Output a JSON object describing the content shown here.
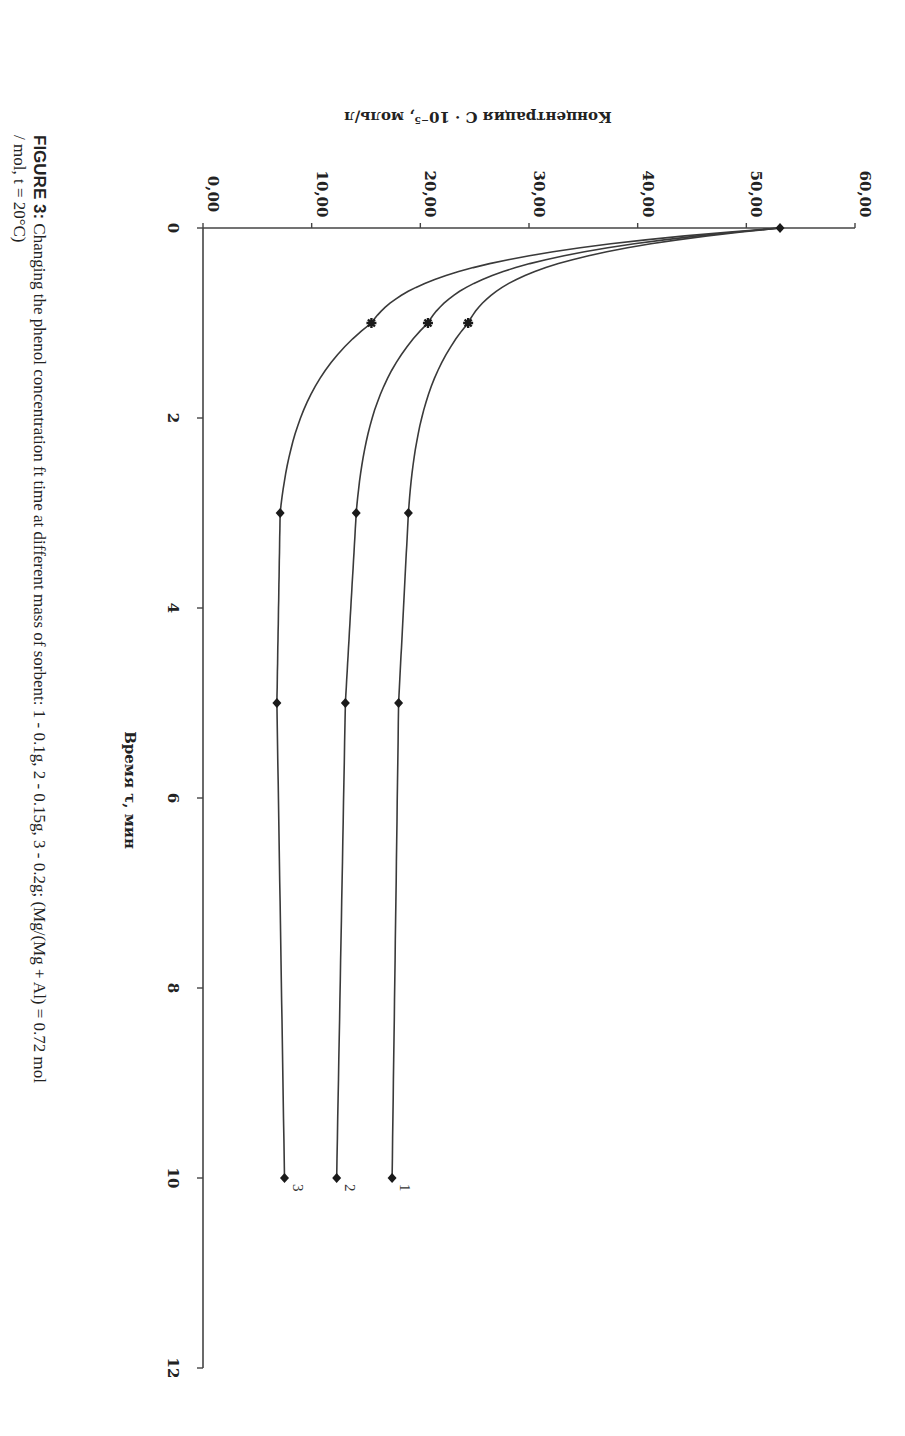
{
  "figure": {
    "caption_label": "FIGURE 3:",
    "caption_line1": " Changing the phenol concentration ft time at different mass of sorbent: 1 - 0.1g, 2 - 0.15g, 3 - 0.2g; (Mg/(Mg + Al) = 0.72 mol",
    "caption_line2": "/ mol, t = 20°C)",
    "orientation": "rotated 90° clockwise"
  },
  "chart_data": {
    "type": "line",
    "title": "",
    "xlabel": "Время τ, мин",
    "ylabel": "Концентрация C · 10⁻⁵, моль/л",
    "xlim": [
      0,
      12
    ],
    "ylim": [
      0,
      60
    ],
    "x_ticks": [
      "0",
      "2",
      "4",
      "6",
      "8",
      "10",
      "12"
    ],
    "y_ticks": [
      "0,00",
      "10,00",
      "20,00",
      "30,00",
      "40,00",
      "50,00",
      "60,00"
    ],
    "grid": false,
    "legend": "inline labels at line ends (1, 2, 3)",
    "x": [
      0,
      1,
      3,
      5,
      10
    ],
    "series": [
      {
        "name": "1",
        "label": "1",
        "description": "0.1 g sorbent",
        "values": [
          53.1,
          24.4,
          18.9,
          18.0,
          17.4
        ]
      },
      {
        "name": "2",
        "label": "2",
        "description": "0.15 g sorbent",
        "values": [
          53.1,
          20.7,
          14.1,
          13.1,
          12.3
        ]
      },
      {
        "name": "3",
        "label": "3",
        "description": "0.2 g sorbent",
        "values": [
          53.1,
          15.5,
          7.1,
          6.8,
          7.5
        ]
      }
    ]
  },
  "colors": {
    "line": "#3a3a3a",
    "axis": "#444444",
    "marker": "#1a1a1a",
    "text": "#222222"
  }
}
